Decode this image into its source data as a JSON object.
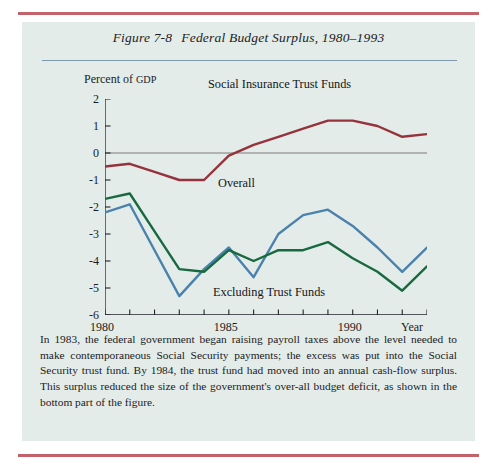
{
  "page": {
    "background": "#ffffff",
    "figure_background": "#e3ecea",
    "rule_color": "#c2636c",
    "title_rule_color": "#7e99ae"
  },
  "figure": {
    "number": "Figure 7-8",
    "title": "Federal Budget Surplus, 1980–1993",
    "caption": "In 1983, the federal government began raising payroll taxes above the level needed to make contemporaneous Social Security payments; the excess was put into the Social Security trust fund. By 1984, the trust fund had moved into an annual cash-flow surplus. This surplus reduced the size of the government's over-all budget deficit, as shown in the bottom part of the figure."
  },
  "chart_data": {
    "type": "line",
    "title": "Federal Budget Surplus, 1980–1993",
    "xlabel": "Year",
    "ylabel": "Percent of GDP",
    "ylabel_parts": {
      "lead": "Percent of ",
      "acronym": "GDP"
    },
    "x": [
      1980,
      1981,
      1982,
      1983,
      1984,
      1985,
      1986,
      1987,
      1988,
      1989,
      1990,
      1991,
      1992,
      1993
    ],
    "xlim": [
      1980,
      1993
    ],
    "ylim": [
      -6,
      2
    ],
    "yticks": [
      2,
      1,
      0,
      -1,
      -2,
      -3,
      -4,
      -5,
      -6
    ],
    "xticks": [
      1980,
      1981,
      1982,
      1983,
      1984,
      1985,
      1986,
      1987,
      1988,
      1989,
      1990,
      1991,
      1992,
      1993
    ],
    "xtick_labels": [
      {
        "value": 1980,
        "label": "1980"
      },
      {
        "value": 1985,
        "label": "1985"
      },
      {
        "value": 1990,
        "label": "1990"
      }
    ],
    "grid": false,
    "zero_line": true,
    "legend": "inline-annotations",
    "series": [
      {
        "name": "Social Insurance Trust Funds",
        "color": "#96323c",
        "values": [
          -0.5,
          -0.4,
          -0.7,
          -1.0,
          -1.0,
          -0.1,
          0.3,
          0.6,
          0.9,
          1.2,
          1.2,
          1.0,
          0.6,
          0.7
        ]
      },
      {
        "name": "Overall",
        "color": "#4a81ad",
        "values": [
          -2.2,
          -1.9,
          -3.6,
          -5.3,
          -4.3,
          -3.5,
          -4.6,
          -3.0,
          -2.3,
          -2.1,
          -2.7,
          -3.5,
          -4.4,
          -3.5
        ]
      },
      {
        "name": "Excluding Trust Funds",
        "color": "#18693f",
        "values": [
          -1.7,
          -1.5,
          -2.9,
          -4.3,
          -4.4,
          -3.6,
          -4.0,
          -3.6,
          -3.6,
          -3.3,
          -3.9,
          -4.4,
          -5.1,
          -4.2
        ]
      }
    ],
    "annotations": [
      {
        "text": "Social Insurance Trust Funds",
        "series": "Social Insurance Trust Funds"
      },
      {
        "text": "Overall",
        "series": "Overall"
      },
      {
        "text": "Excluding Trust Funds",
        "series": "Excluding Trust Funds"
      }
    ]
  }
}
